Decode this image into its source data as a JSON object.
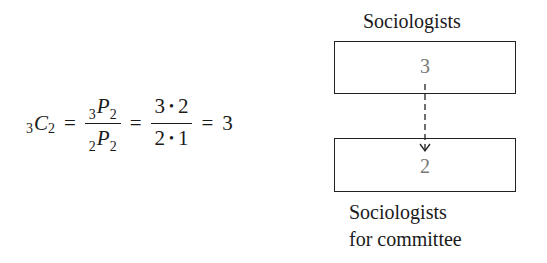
{
  "formula": {
    "lhs": {
      "pre_sub": "3",
      "symbol": "C",
      "sub": "2"
    },
    "eq1": "=",
    "frac1": {
      "num": {
        "pre_sub": "3",
        "symbol": "P",
        "sub": "2"
      },
      "den": {
        "pre_sub": "2",
        "symbol": "P",
        "sub": "2"
      }
    },
    "eq2": "=",
    "frac2": {
      "num": {
        "a": "3",
        "op": "•",
        "b": "2"
      },
      "den": {
        "a": "2",
        "op": "•",
        "b": "1"
      }
    },
    "eq3": "=",
    "result": "3"
  },
  "diagram": {
    "top_label": "Sociologists",
    "top_box_value": "3",
    "bottom_box_value": "2",
    "bottom_label_line1": "Sociologists",
    "bottom_label_line2": "for committee",
    "arrow_style": "dashed",
    "number_color": "#777777"
  }
}
